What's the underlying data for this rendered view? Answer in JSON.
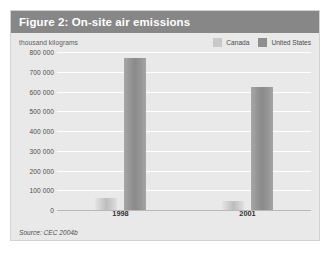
{
  "figure": {
    "title": "Figure 2: On-site air emissions",
    "source_note": "Source: CEC 2004b"
  },
  "legend": {
    "items": [
      {
        "label": "Canada",
        "color": "#c9c9c9",
        "swatch_name": "legend-swatch-canada"
      },
      {
        "label": "United States",
        "color": "#8f8f8f",
        "swatch_name": "legend-swatch-united-states"
      }
    ]
  },
  "chart_data": {
    "type": "bar",
    "title": "Figure 2: On-site air emissions",
    "xlabel": "",
    "ylabel": "thousand kilograms",
    "categories": [
      "1998",
      "2001"
    ],
    "series": [
      {
        "name": "Canada",
        "values": [
          60000,
          45000
        ],
        "color": "#c9c9c9"
      },
      {
        "name": "United States",
        "values": [
          770000,
          625000
        ],
        "color": "#8f8f8f"
      }
    ],
    "ylim": [
      0,
      800000
    ],
    "ytick_values": [
      0,
      100000,
      200000,
      300000,
      400000,
      500000,
      600000,
      700000,
      800000
    ],
    "ytick_labels": [
      "0",
      "100 000",
      "200 000",
      "300 000",
      "400 000",
      "500 000",
      "600 000",
      "700 000",
      "800 000"
    ],
    "grid": true,
    "legend_position": "top-right",
    "source": "Source: CEC 2004b"
  }
}
